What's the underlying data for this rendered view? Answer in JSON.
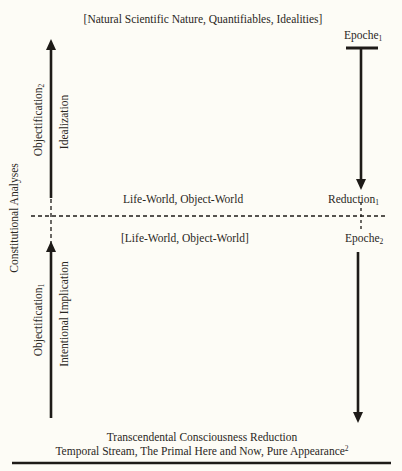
{
  "diagram": {
    "top_label": "[Natural Scientific Nature, Quantifiables, Idealities]",
    "epoche1": {
      "base": "Epoche",
      "sub": "1"
    },
    "reduction1": {
      "base": "Reduction",
      "sub": "1"
    },
    "epoche2": {
      "base": "Epoche",
      "sub": "2"
    },
    "life_world_upper": "Life-World, Object-World",
    "life_world_lower": "[Life-World, Object-World]",
    "constitutional_analyses": "Constitutional Analyses",
    "objectification2": {
      "base": "Objectification",
      "sub": "2"
    },
    "idealization": "Idealization",
    "objectification1": {
      "base": "Objectification",
      "sub": "1"
    },
    "intentional_implication": "Intentional Implication",
    "bottom_line1": "Transcendental Consciousness Reduction",
    "bottom_line2": {
      "text": "Temporal Stream, The Primal Here and Now, Pure Appearance",
      "sup": "2"
    },
    "colors": {
      "background": "#fdfcf6",
      "ink": "#2a2723"
    }
  }
}
